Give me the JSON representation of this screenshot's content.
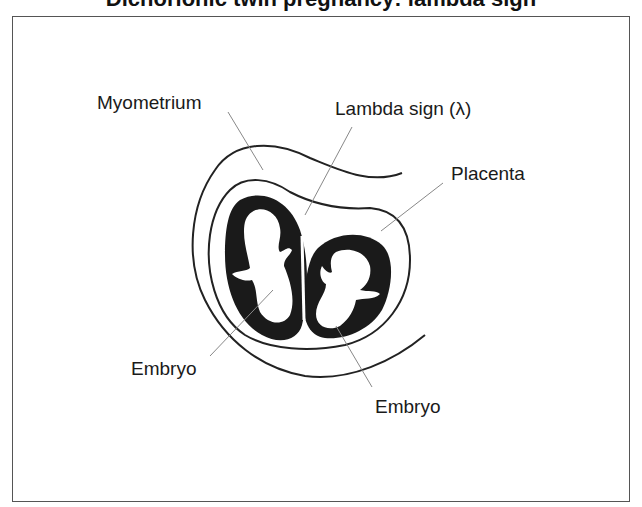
{
  "figure": {
    "title_fragment": "Dichorionic twin pregnancy: lambda sign",
    "labels": {
      "myometrium": "Myometrium",
      "lambda_sign": "Lambda sign (λ)",
      "placenta": "Placenta",
      "embryo_left": "Embryo",
      "embryo_right": "Embryo"
    },
    "colors": {
      "frame": "#555555",
      "outline": "#222222",
      "leader": "#888888",
      "chorion": "#1a1a1a",
      "background": "#ffffff"
    }
  }
}
